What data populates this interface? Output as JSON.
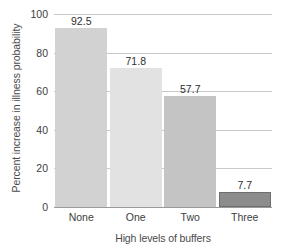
{
  "chart_data": {
    "type": "bar",
    "title": "",
    "categories": [
      "None",
      "One",
      "Two",
      "Three"
    ],
    "values": [
      92.5,
      71.8,
      57.7,
      7.7
    ],
    "value_labels": [
      "92.5",
      "71.8",
      "57.7",
      "7.7"
    ],
    "xlabel": "High levels of buffers",
    "ylabel": "Percent increase in illness probability",
    "ylim": [
      0,
      100
    ],
    "yticks": [
      0,
      20,
      40,
      60,
      80,
      100
    ],
    "ytick_labels": [
      "0",
      "20",
      "40",
      "60",
      "80",
      "100"
    ],
    "grid": true,
    "legend": false,
    "bar_colors": [
      "#d2d2d2",
      "#e2e2e2",
      "#c4c4c4",
      "#8c8c8c"
    ],
    "bar_edge_colors": [
      "#d2d2d2",
      "#e2e2e2",
      "#c4c4c4",
      "#6e6e6e"
    ],
    "gridline_color": "#c9c9c9",
    "axis_color": "#9a9a9a",
    "background_color": "#ffffff"
  }
}
